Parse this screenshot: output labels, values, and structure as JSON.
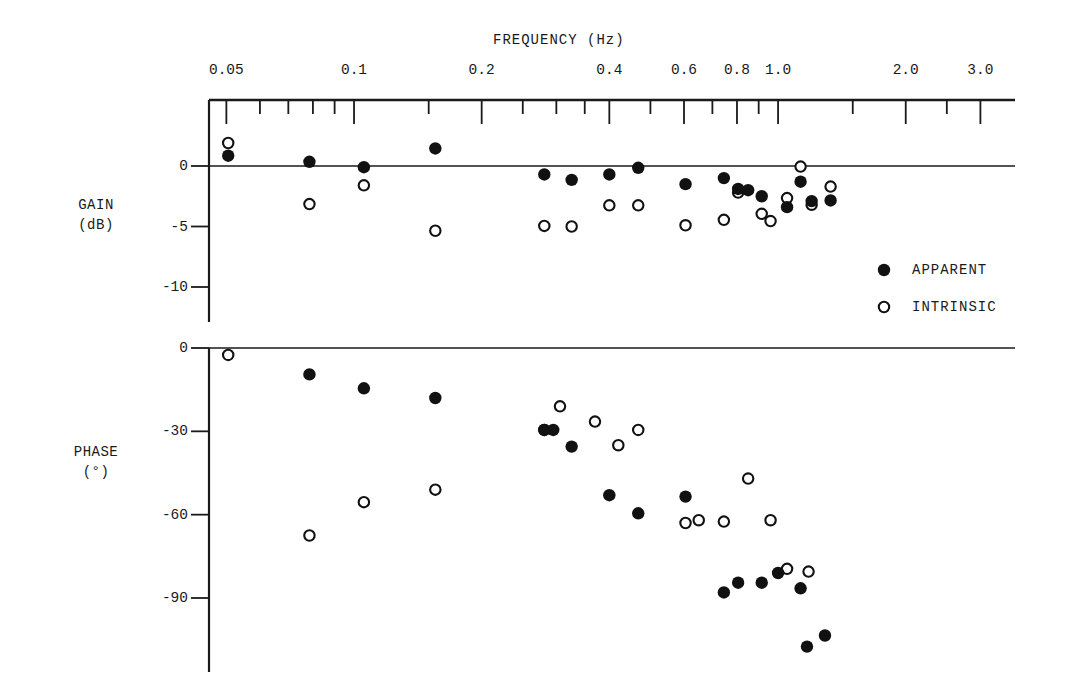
{
  "figure": {
    "background": "#ffffff",
    "ink_color": "#111111",
    "width": 1068,
    "height": 693
  },
  "chart_data": {
    "type": "scatter",
    "title": "",
    "xlabel": "FREQUENCY (Hz)",
    "xscale": "log",
    "xlim": [
      0.04,
      3.6
    ],
    "xticklabels": [
      "0.05",
      "0.1",
      "0.2",
      "0.4",
      "0.6",
      "0.8",
      "1.0",
      "2.0",
      "3.0"
    ],
    "xtickvalues": [
      0.05,
      0.1,
      0.2,
      0.4,
      0.6,
      0.8,
      1.0,
      2.0,
      3.0
    ],
    "xminorticks": [
      0.05,
      0.06,
      0.07,
      0.08,
      0.09,
      0.1,
      0.15,
      0.2,
      0.25,
      0.3,
      0.35,
      0.4,
      0.5,
      0.6,
      0.7,
      0.8,
      0.9,
      1.0,
      1.5,
      2.0,
      2.5,
      3.0
    ],
    "grid": false,
    "legend_position": "right-middle",
    "panels": [
      {
        "id": "gain",
        "ylabel": "GAIN",
        "yunits": "(dB)",
        "ylabel_lines": [
          "GAIN",
          "(dB)"
        ],
        "yticklabels": [
          "0",
          "-5",
          "-10"
        ],
        "ytickvalues": [
          0,
          -5,
          -10
        ],
        "ylim": [
          -12.5,
          4.0
        ],
        "zero_line": 0,
        "series": [
          {
            "name": "APPARENT",
            "marker": "filled-circle",
            "points": [
              [
                0.0505,
                0.85
              ],
              [
                0.0785,
                0.35
              ],
              [
                0.1055,
                -0.1
              ],
              [
                0.1555,
                1.45
              ],
              [
                0.281,
                -0.7
              ],
              [
                0.326,
                -1.15
              ],
              [
                0.4,
                -0.7
              ],
              [
                0.468,
                -0.15
              ],
              [
                0.605,
                -1.5
              ],
              [
                0.745,
                -1.0
              ],
              [
                0.805,
                -1.9
              ],
              [
                0.85,
                -2.0
              ],
              [
                0.915,
                -2.5
              ],
              [
                1.05,
                -3.4
              ],
              [
                1.13,
                -1.3
              ],
              [
                1.2,
                -2.9
              ],
              [
                1.33,
                -2.85
              ]
            ]
          },
          {
            "name": "INTRINSIC",
            "marker": "open-circle",
            "points": [
              [
                0.0505,
                1.9
              ],
              [
                0.0785,
                -3.15
              ],
              [
                0.1055,
                -1.6
              ],
              [
                0.1555,
                -5.35
              ],
              [
                0.281,
                -4.95
              ],
              [
                0.326,
                -5.0
              ],
              [
                0.4,
                -3.25
              ],
              [
                0.468,
                -3.25
              ],
              [
                0.605,
                -4.9
              ],
              [
                0.745,
                -4.45
              ],
              [
                0.805,
                -2.2
              ],
              [
                0.915,
                -3.95
              ],
              [
                0.96,
                -4.55
              ],
              [
                1.05,
                -2.65
              ],
              [
                1.13,
                -0.05
              ],
              [
                1.2,
                -3.2
              ],
              [
                1.33,
                -1.7
              ]
            ]
          }
        ]
      },
      {
        "id": "phase",
        "ylabel": "PHASE",
        "yunits": "(°)",
        "ylabel_lines": [
          "PHASE",
          "(°)"
        ],
        "yticklabels": [
          "0",
          "-30",
          "-60",
          "-90"
        ],
        "ytickvalues": [
          0,
          -30,
          -60,
          -90
        ],
        "ylim": [
          -118,
          4
        ],
        "zero_line": 0,
        "series": [
          {
            "name": "APPARENT",
            "marker": "filled-circle",
            "points": [
              [
                0.0785,
                -9.5
              ],
              [
                0.1055,
                -14.5
              ],
              [
                0.1555,
                -18.0
              ],
              [
                0.281,
                -29.5
              ],
              [
                0.295,
                -29.5
              ],
              [
                0.326,
                -35.5
              ],
              [
                0.4,
                -53.0
              ],
              [
                0.468,
                -59.5
              ],
              [
                0.605,
                -53.5
              ],
              [
                0.745,
                -88.0
              ],
              [
                0.805,
                -84.5
              ],
              [
                0.915,
                -84.5
              ],
              [
                1.0,
                -81.0
              ],
              [
                1.13,
                -86.5
              ],
              [
                1.17,
                -107.5
              ],
              [
                1.29,
                -103.5
              ]
            ]
          },
          {
            "name": "INTRINSIC",
            "marker": "open-circle",
            "points": [
              [
                0.0505,
                -2.5
              ],
              [
                0.0785,
                -67.5
              ],
              [
                0.1055,
                -55.5
              ],
              [
                0.1555,
                -51.0
              ],
              [
                0.281,
                -29.5
              ],
              [
                0.306,
                -21.0
              ],
              [
                0.37,
                -26.5
              ],
              [
                0.42,
                -35.0
              ],
              [
                0.468,
                -29.5
              ],
              [
                0.605,
                -63.0
              ],
              [
                0.65,
                -62.0
              ],
              [
                0.745,
                -62.5
              ],
              [
                0.85,
                -47.0
              ],
              [
                0.96,
                -62.0
              ],
              [
                1.05,
                -79.5
              ],
              [
                1.18,
                -80.5
              ]
            ]
          }
        ]
      }
    ],
    "legend": [
      {
        "label": "APPARENT",
        "marker": "filled-circle"
      },
      {
        "label": "INTRINSIC",
        "marker": "open-circle"
      }
    ]
  }
}
